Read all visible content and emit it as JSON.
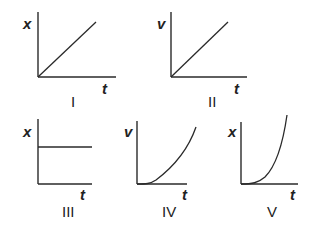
{
  "figure": {
    "graphs": [
      {
        "id": "I",
        "roman": "I",
        "y_label": "x",
        "x_label": "t",
        "shape": "straight line through origin with positive slope"
      },
      {
        "id": "II",
        "roman": "II",
        "y_label": "v",
        "x_label": "t",
        "shape": "straight line through origin with positive slope"
      },
      {
        "id": "III",
        "roman": "III",
        "y_label": "x",
        "x_label": "t",
        "shape": "horizontal line (constant)"
      },
      {
        "id": "IV",
        "roman": "IV",
        "y_label": "v",
        "x_label": "t",
        "shape": "concave-up curve starting at origin, increasing"
      },
      {
        "id": "V",
        "roman": "V",
        "y_label": "x",
        "x_label": "t",
        "shape": "concave-up curve starting at origin, increasing steeply"
      }
    ]
  },
  "colors": {
    "ink": "#2a2a2a",
    "background": "#ffffff"
  }
}
